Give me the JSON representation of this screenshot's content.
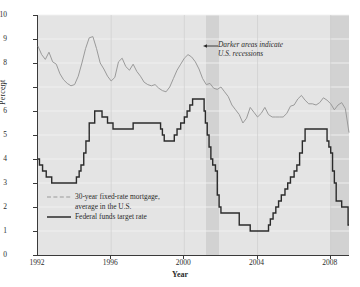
{
  "chart_data": {
    "type": "line",
    "title": "",
    "xlabel": "Year",
    "ylabel": "Percent",
    "xlim": [
      1992,
      2009
    ],
    "ylim": [
      0,
      10
    ],
    "xticks": [
      "1992",
      "1996",
      "2000",
      "2004",
      "2008"
    ],
    "xtick_values": [
      1992,
      1996,
      2000,
      2004,
      2008
    ],
    "yticks": [
      "0",
      "1",
      "2",
      "3",
      "4",
      "5",
      "6",
      "7",
      "8",
      "9",
      "10"
    ],
    "ytick_values": [
      0,
      1,
      2,
      3,
      4,
      5,
      6,
      7,
      8,
      9,
      10
    ],
    "grid": true,
    "legend_position": "lower-left",
    "annotations": [
      {
        "name": "recession-note",
        "text_line1": "Darker areas indicate",
        "text_line2": "U.S. recessions",
        "style": "italic",
        "arrow": "left"
      }
    ],
    "shaded_regions": [
      {
        "name": "recession-2001",
        "x_start": 2001.2,
        "x_end": 2001.92,
        "color": "#d2d2d2"
      },
      {
        "name": "recession-2008",
        "x_start": 2007.95,
        "x_end": 2009.0,
        "color": "#d2d2d2"
      }
    ],
    "series": [
      {
        "name": "30-year fixed-rate mortgage, average in the U.S.",
        "style": "dashed-light",
        "color": "#9a9a9a",
        "x": [
          1992.0,
          1992.2,
          1992.4,
          1992.6,
          1992.8,
          1993.0,
          1993.2,
          1993.4,
          1993.6,
          1993.8,
          1994.0,
          1994.2,
          1994.4,
          1994.6,
          1994.8,
          1995.0,
          1995.2,
          1995.4,
          1995.6,
          1995.8,
          1996.0,
          1996.2,
          1996.4,
          1996.6,
          1996.8,
          1997.0,
          1997.2,
          1997.4,
          1997.6,
          1997.8,
          1998.0,
          1998.2,
          1998.4,
          1998.6,
          1998.8,
          1999.0,
          1999.2,
          1999.4,
          1999.6,
          1999.8,
          2000.0,
          2000.2,
          2000.4,
          2000.6,
          2000.8,
          2001.0,
          2001.2,
          2001.4,
          2001.6,
          2001.8,
          2002.0,
          2002.2,
          2002.4,
          2002.6,
          2002.8,
          2003.0,
          2003.2,
          2003.4,
          2003.6,
          2003.8,
          2004.0,
          2004.2,
          2004.4,
          2004.6,
          2004.8,
          2005.0,
          2005.2,
          2005.4,
          2005.6,
          2005.8,
          2006.0,
          2006.2,
          2006.4,
          2006.6,
          2006.8,
          2007.0,
          2007.2,
          2007.4,
          2007.6,
          2007.8,
          2008.0,
          2008.2,
          2008.4,
          2008.6,
          2008.8,
          2009.0
        ],
        "y": [
          8.7,
          8.35,
          8.15,
          8.45,
          8.05,
          7.95,
          7.55,
          7.3,
          7.15,
          7.05,
          7.1,
          7.45,
          8.0,
          8.6,
          9.05,
          9.1,
          8.6,
          8.0,
          7.75,
          7.45,
          7.25,
          7.4,
          8.05,
          8.2,
          7.85,
          7.7,
          7.95,
          7.65,
          7.45,
          7.2,
          7.1,
          7.05,
          7.1,
          6.95,
          6.85,
          6.8,
          7.0,
          7.35,
          7.7,
          7.95,
          8.2,
          8.35,
          8.25,
          8.05,
          7.75,
          7.35,
          7.1,
          7.15,
          6.95,
          6.9,
          7.0,
          6.8,
          6.6,
          6.25,
          6.05,
          5.85,
          5.5,
          5.7,
          6.15,
          5.95,
          5.75,
          5.9,
          6.15,
          5.85,
          5.75,
          5.75,
          5.75,
          5.75,
          5.9,
          6.2,
          6.25,
          6.5,
          6.65,
          6.45,
          6.3,
          6.3,
          6.25,
          6.35,
          6.55,
          6.45,
          6.3,
          6.05,
          6.25,
          6.35,
          6.1,
          5.1
        ]
      },
      {
        "name": "Federal funds target rate",
        "style": "solid-dark",
        "color": "#2b2b2b",
        "step": true,
        "x": [
          1992.0,
          1992.08,
          1992.25,
          1992.45,
          1992.75,
          1993.0,
          1993.5,
          1994.0,
          1994.1,
          1994.25,
          1994.35,
          1994.5,
          1994.62,
          1994.8,
          1995.0,
          1995.1,
          1995.25,
          1995.5,
          1995.6,
          1995.8,
          1996.0,
          1996.1,
          1996.5,
          1997.2,
          1997.3,
          1998.0,
          1998.7,
          1998.8,
          1998.9,
          1999.0,
          1999.45,
          1999.6,
          1999.8,
          2000.0,
          2000.15,
          2000.3,
          2000.45,
          2001.0,
          2001.08,
          2001.15,
          2001.25,
          2001.35,
          2001.45,
          2001.55,
          2001.7,
          2001.8,
          2001.9,
          2002.0,
          2002.9,
          2003.0,
          2003.5,
          2003.6,
          2004.0,
          2004.5,
          2004.6,
          2004.7,
          2004.85,
          2005.0,
          2005.15,
          2005.3,
          2005.5,
          2005.65,
          2005.8,
          2006.0,
          2006.15,
          2006.3,
          2006.45,
          2006.6,
          2007.0,
          2007.7,
          2007.8,
          2007.9,
          2008.0,
          2008.1,
          2008.2,
          2008.3,
          2008.6,
          2008.8,
          2008.95
        ],
        "y": [
          4.0,
          3.75,
          3.5,
          3.25,
          3.0,
          3.0,
          3.0,
          3.0,
          3.25,
          3.5,
          3.75,
          4.25,
          4.75,
          5.5,
          5.5,
          6.0,
          6.0,
          5.75,
          5.75,
          5.5,
          5.5,
          5.25,
          5.25,
          5.5,
          5.5,
          5.5,
          5.25,
          5.0,
          4.75,
          4.75,
          5.0,
          5.25,
          5.5,
          5.75,
          6.0,
          6.25,
          6.5,
          6.5,
          6.0,
          5.5,
          5.0,
          4.5,
          4.0,
          3.75,
          3.5,
          2.5,
          2.0,
          1.75,
          1.75,
          1.25,
          1.25,
          1.0,
          1.0,
          1.0,
          1.25,
          1.5,
          1.75,
          2.0,
          2.25,
          2.5,
          2.75,
          3.0,
          3.25,
          3.5,
          3.75,
          4.25,
          4.75,
          5.25,
          5.25,
          5.25,
          4.75,
          4.5,
          4.25,
          3.5,
          3.0,
          2.25,
          2.0,
          2.0,
          1.25
        ]
      }
    ]
  },
  "legend": {
    "items": [
      {
        "label_line1": "30-year fixed-rate mortgage,",
        "label_line2": "average in the U.S.",
        "swatch": "dashed-light-line"
      },
      {
        "label_line1": "Federal funds target rate",
        "label_line2": "",
        "swatch": "solid-dark-line"
      }
    ]
  },
  "axis": {
    "y_title": "Percent",
    "x_title": "Year"
  },
  "colors": {
    "plot_background": "#e4e4e4",
    "recession_shade": "#d2d2d2",
    "grid": "#f2f2f2",
    "axis": "#3a3a3a",
    "mortgage_line": "#9a9a9a",
    "fedfunds_line": "#2b2b2b",
    "text": "#2b2b2b"
  }
}
